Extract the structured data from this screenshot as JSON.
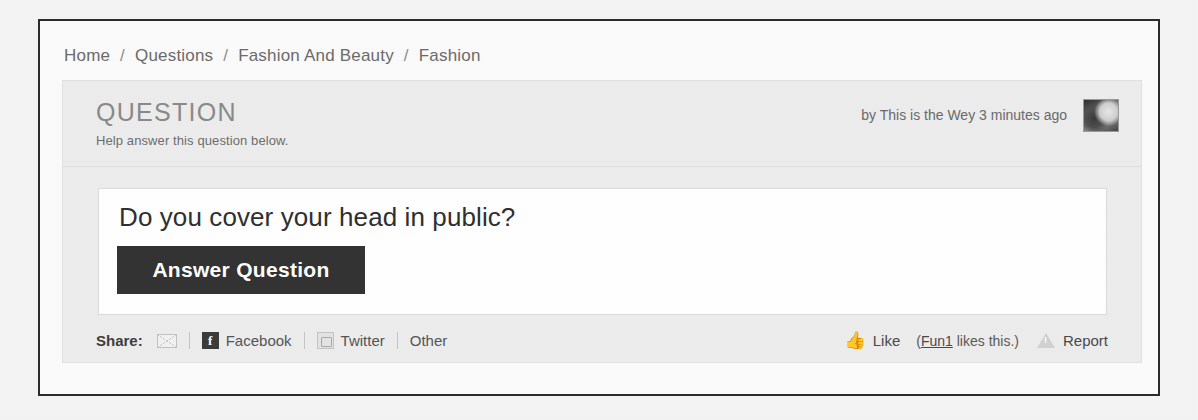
{
  "breadcrumb": {
    "separator": "/",
    "items": [
      "Home",
      "Questions",
      "Fashion And Beauty",
      "Fashion"
    ]
  },
  "card": {
    "header": {
      "title": "QUESTION",
      "subtitle": "Help answer this question below.",
      "byline": "by This is the Wey 3 minutes ago",
      "avatar_icon": "user-avatar-photo"
    },
    "body": {
      "question_title": "Do you cover your head in public?",
      "answer_button": "Answer Question"
    },
    "footer": {
      "share_label": "Share:",
      "email_icon": "envelope-icon",
      "facebook_icon": "facebook-icon",
      "facebook_glyph": "f",
      "facebook_label": "Facebook",
      "twitter_icon": "twitter-icon",
      "twitter_label": "Twitter",
      "other_label": "Other",
      "thumb_icon": "thumbs-up-icon",
      "thumb_glyph": "👍",
      "like_label": "Like",
      "likes_note_open": "(",
      "likes_note_liker": "Fun1",
      "likes_note_rest": " likes this.)",
      "warning_icon": "warning-triangle-icon",
      "report_label": "Report"
    }
  },
  "colors": {
    "frame_border": "#2b2b2b",
    "card_bg": "#ededed",
    "button_bg": "#333333",
    "text_dark": "#2f2f2f",
    "text_muted": "#6b6b6b"
  }
}
